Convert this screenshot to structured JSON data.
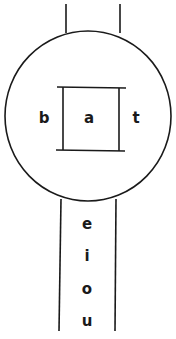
{
  "diagram": {
    "inner_labels": {
      "left": "b",
      "center": "a",
      "right": "t"
    },
    "stem_labels": [
      "e",
      "i",
      "o",
      "u"
    ],
    "colors": {
      "stroke": "#1a1a1a",
      "background": "#ffffff"
    }
  }
}
